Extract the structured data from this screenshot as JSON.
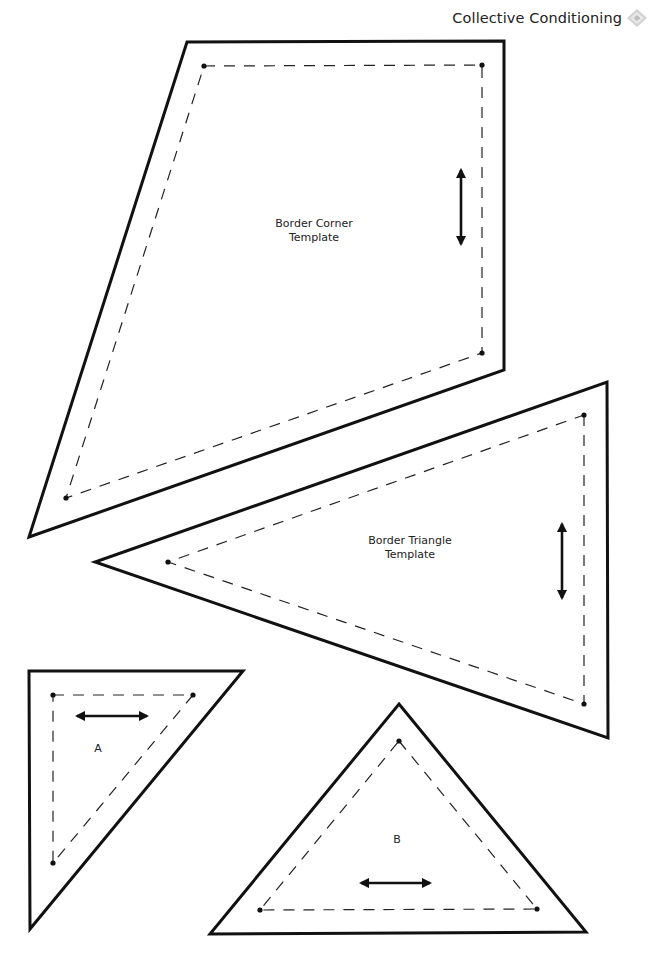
{
  "header": {
    "title": "Collective Conditioning",
    "logo_icon": "diamond-logo-icon"
  },
  "templates": {
    "border_corner": {
      "label_line1": "Border Corner",
      "label_line2": "Template",
      "grain_arrow": "vertical"
    },
    "border_triangle": {
      "label_line1": "Border Triangle",
      "label_line2": "Template",
      "grain_arrow": "vertical"
    },
    "piece_a": {
      "label": "A",
      "grain_arrow": "horizontal"
    },
    "piece_b": {
      "label": "B",
      "grain_arrow": "horizontal"
    }
  },
  "colors": {
    "line": "#111111",
    "background": "#ffffff",
    "logo": "#c8c8c8"
  }
}
